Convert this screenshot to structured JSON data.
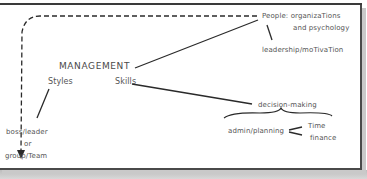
{
  "diagram": {
    "root": "MANAGEMENT",
    "branches": {
      "styles": "Styles",
      "skills": "Skills"
    },
    "people": {
      "line1": "People: organizaTions",
      "line2": "and psychology",
      "child": "leadership/moTivaTion"
    },
    "styles_child": {
      "line1": "boss/leader",
      "line2": "or",
      "line3": "group/Team"
    },
    "skills_children": {
      "decision": "decision-making",
      "admin": "admin/planning",
      "time": "Time",
      "finance": "finance"
    },
    "colors": {
      "ink": "#555555",
      "line": "#2a2a2a",
      "frame": "#4a4a4a",
      "shadow": "#c9c9c9"
    }
  }
}
